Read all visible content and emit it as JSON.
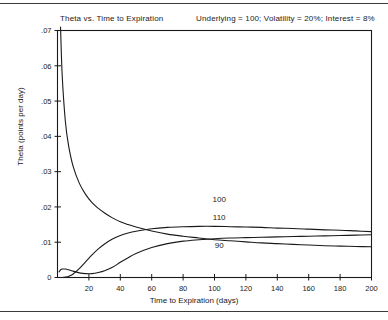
{
  "figure": {
    "title": "Theta vs. Time to Expiration",
    "annotation": "Underlying = 100;  Volatility = 20%;  Interest = 8%"
  },
  "chart_data": {
    "type": "line",
    "title": "Theta vs. Time to Expiration",
    "subtitle": "Underlying = 100;  Volatility = 20%;  Interest = 8%",
    "xlabel": "Time to Expiration (days)",
    "ylabel": "Theta (points per day)",
    "xlim": [
      0,
      200
    ],
    "ylim": [
      0,
      0.07
    ],
    "grid": false,
    "legend": "inline-curve-labels",
    "xticks": [
      0,
      20,
      40,
      60,
      80,
      100,
      120,
      140,
      160,
      180,
      200
    ],
    "xticklabels": [
      "0",
      "20",
      "40",
      "60",
      "80",
      "100",
      "120",
      "140",
      "160",
      "180",
      "200"
    ],
    "yticks": [
      0,
      0.01,
      0.02,
      0.03,
      0.04,
      0.05,
      0.06,
      0.07
    ],
    "yticklabels": [
      "0",
      ".01",
      ".02",
      ".03",
      ".04",
      ".05",
      ".06",
      ".07"
    ],
    "annotations": [
      {
        "text": "Underlying = 100",
        "value": 100
      },
      {
        "text": "Volatility = 20%",
        "value": 0.2
      },
      {
        "text": "Interest = 8%",
        "value": 0.08
      }
    ],
    "x": [
      1,
      2,
      3,
      5,
      7,
      10,
      14,
      18,
      22,
      26,
      30,
      35,
      40,
      45,
      50,
      60,
      70,
      80,
      90,
      100,
      110,
      120,
      130,
      140,
      150,
      160,
      170,
      180,
      190,
      200
    ],
    "series": [
      {
        "name": "100",
        "label": "100",
        "label_x": 103,
        "label_y": 0.0215,
        "values": [
          0.099,
          0.07,
          0.0572,
          0.0443,
          0.0375,
          0.0314,
          0.0266,
          0.0235,
          0.0212,
          0.0196,
          0.0183,
          0.0169,
          0.0158,
          0.015,
          0.0143,
          0.0132,
          0.0123,
          0.0117,
          0.0112,
          0.0107,
          0.0104,
          0.0101,
          0.0098,
          0.0096,
          0.0094,
          0.0092,
          0.009,
          0.0089,
          0.0088,
          0.0087
        ]
      },
      {
        "name": "110",
        "label": "110",
        "label_x": 103,
        "label_y": 0.0163,
        "values": [
          0.0,
          0.0,
          0.0,
          0.0001,
          0.0003,
          0.001,
          0.0026,
          0.0045,
          0.0064,
          0.0081,
          0.0095,
          0.0109,
          0.0119,
          0.0126,
          0.0131,
          0.0138,
          0.0142,
          0.0144,
          0.0145,
          0.0145,
          0.0144,
          0.0143,
          0.0142,
          0.014,
          0.0139,
          0.0137,
          0.0135,
          0.0134,
          0.0132,
          0.013
        ]
      },
      {
        "name": "90",
        "label": "90",
        "label_x": 103,
        "label_y": 0.0083,
        "values": [
          0.0016,
          0.0022,
          0.0024,
          0.0024,
          0.0022,
          0.0018,
          0.0013,
          0.0011,
          0.0011,
          0.0014,
          0.0019,
          0.0029,
          0.0043,
          0.0056,
          0.0068,
          0.0085,
          0.0096,
          0.0103,
          0.0107,
          0.011,
          0.0112,
          0.0113,
          0.0114,
          0.0115,
          0.0116,
          0.0117,
          0.0118,
          0.0119,
          0.012,
          0.0121
        ]
      }
    ]
  }
}
